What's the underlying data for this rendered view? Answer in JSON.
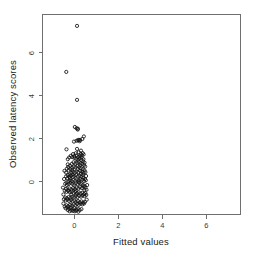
{
  "chart_data": {
    "type": "scatter",
    "title": "",
    "subtitle": "",
    "xlabel": "Fitted values",
    "ylabel": "Observed latency scores",
    "xlim": [
      -1.45,
      7.55
    ],
    "ylim": [
      -1.55,
      7.75
    ],
    "xticks": [
      0,
      2,
      4,
      6
    ],
    "xticklabels": [
      "0",
      "2",
      "4",
      "6"
    ],
    "yticks": [
      0,
      2,
      4,
      6
    ],
    "yticklabels": [
      "0",
      "2",
      "4",
      "6"
    ],
    "grid": false,
    "legend": null,
    "marker": {
      "shape": "open-circle",
      "pch": 1,
      "color": "#111111",
      "fill": "none",
      "size": 3.2
    },
    "frame": "box",
    "annotations": [],
    "points": [
      {
        "x": 0.12,
        "y": 7.22
      },
      {
        "x": -0.37,
        "y": 5.08
      },
      {
        "x": 0.12,
        "y": 3.78
      },
      {
        "x": 0.02,
        "y": 2.52
      },
      {
        "x": 0.1,
        "y": 2.46
      },
      {
        "x": 0.15,
        "y": 2.4
      },
      {
        "x": 0.16,
        "y": 2.44
      },
      {
        "x": 0.43,
        "y": 2.08
      },
      {
        "x": 0.36,
        "y": 1.96
      },
      {
        "x": 0.1,
        "y": 1.88
      },
      {
        "x": 0.16,
        "y": 1.9
      },
      {
        "x": 0.2,
        "y": 1.92
      },
      {
        "x": 0.24,
        "y": 1.86
      },
      {
        "x": 0.26,
        "y": 1.92
      },
      {
        "x": -0.02,
        "y": 1.84
      },
      {
        "x": -0.36,
        "y": 1.48
      },
      {
        "x": 0.12,
        "y": 1.5
      },
      {
        "x": 0.3,
        "y": 1.42
      },
      {
        "x": 0.38,
        "y": 1.3
      },
      {
        "x": 0.42,
        "y": 1.24
      },
      {
        "x": 0.34,
        "y": 1.2
      },
      {
        "x": 0.28,
        "y": 1.26
      },
      {
        "x": 0.2,
        "y": 1.34
      },
      {
        "x": 0.06,
        "y": 1.3
      },
      {
        "x": -0.06,
        "y": 1.26
      },
      {
        "x": -0.16,
        "y": 1.18
      },
      {
        "x": -0.24,
        "y": 1.1
      },
      {
        "x": -0.3,
        "y": 1.02
      },
      {
        "x": -0.1,
        "y": 1.12
      },
      {
        "x": 0.0,
        "y": 1.08
      },
      {
        "x": 0.08,
        "y": 1.04
      },
      {
        "x": 0.16,
        "y": 1.0
      },
      {
        "x": 0.24,
        "y": 1.06
      },
      {
        "x": 0.32,
        "y": 0.98
      },
      {
        "x": 0.4,
        "y": 0.92
      },
      {
        "x": 0.46,
        "y": 0.86
      },
      {
        "x": 0.44,
        "y": 0.74
      },
      {
        "x": 0.36,
        "y": 0.8
      },
      {
        "x": 0.28,
        "y": 0.84
      },
      {
        "x": 0.2,
        "y": 0.9
      },
      {
        "x": 0.12,
        "y": 0.86
      },
      {
        "x": 0.04,
        "y": 0.82
      },
      {
        "x": -0.04,
        "y": 0.88
      },
      {
        "x": -0.12,
        "y": 0.8
      },
      {
        "x": -0.2,
        "y": 0.72
      },
      {
        "x": -0.28,
        "y": 0.66
      },
      {
        "x": -0.34,
        "y": 0.58
      },
      {
        "x": -0.26,
        "y": 0.5
      },
      {
        "x": -0.18,
        "y": 0.56
      },
      {
        "x": -0.1,
        "y": 0.62
      },
      {
        "x": -0.02,
        "y": 0.68
      },
      {
        "x": 0.06,
        "y": 0.64
      },
      {
        "x": 0.14,
        "y": 0.7
      },
      {
        "x": 0.22,
        "y": 0.66
      },
      {
        "x": 0.3,
        "y": 0.6
      },
      {
        "x": 0.38,
        "y": 0.56
      },
      {
        "x": 0.46,
        "y": 0.5
      },
      {
        "x": 0.5,
        "y": 0.42
      },
      {
        "x": 0.42,
        "y": 0.38
      },
      {
        "x": 0.34,
        "y": 0.44
      },
      {
        "x": 0.26,
        "y": 0.48
      },
      {
        "x": 0.18,
        "y": 0.42
      },
      {
        "x": 0.1,
        "y": 0.46
      },
      {
        "x": 0.02,
        "y": 0.4
      },
      {
        "x": -0.06,
        "y": 0.44
      },
      {
        "x": -0.14,
        "y": 0.38
      },
      {
        "x": -0.22,
        "y": 0.32
      },
      {
        "x": -0.3,
        "y": 0.28
      },
      {
        "x": -0.38,
        "y": 0.22
      },
      {
        "x": -0.32,
        "y": 0.14
      },
      {
        "x": -0.24,
        "y": 0.2
      },
      {
        "x": -0.16,
        "y": 0.26
      },
      {
        "x": -0.08,
        "y": 0.3
      },
      {
        "x": 0.0,
        "y": 0.24
      },
      {
        "x": 0.08,
        "y": 0.28
      },
      {
        "x": 0.16,
        "y": 0.22
      },
      {
        "x": 0.24,
        "y": 0.26
      },
      {
        "x": 0.32,
        "y": 0.2
      },
      {
        "x": 0.4,
        "y": 0.16
      },
      {
        "x": 0.48,
        "y": 0.1
      },
      {
        "x": 0.52,
        "y": 0.04
      },
      {
        "x": 0.44,
        "y": 0.0
      },
      {
        "x": 0.36,
        "y": 0.06
      },
      {
        "x": 0.28,
        "y": 0.1
      },
      {
        "x": 0.2,
        "y": 0.04
      },
      {
        "x": 0.12,
        "y": 0.08
      },
      {
        "x": 0.04,
        "y": 0.02
      },
      {
        "x": -0.04,
        "y": 0.06
      },
      {
        "x": -0.12,
        "y": 0.0
      },
      {
        "x": -0.2,
        "y": 0.04
      },
      {
        "x": -0.28,
        "y": -0.02
      },
      {
        "x": -0.36,
        "y": -0.06
      },
      {
        "x": -0.42,
        "y": -0.12
      },
      {
        "x": -0.34,
        "y": -0.18
      },
      {
        "x": -0.26,
        "y": -0.14
      },
      {
        "x": -0.18,
        "y": -0.08
      },
      {
        "x": -0.1,
        "y": -0.12
      },
      {
        "x": -0.02,
        "y": -0.16
      },
      {
        "x": 0.06,
        "y": -0.1
      },
      {
        "x": 0.14,
        "y": -0.14
      },
      {
        "x": 0.22,
        "y": -0.08
      },
      {
        "x": 0.3,
        "y": -0.12
      },
      {
        "x": 0.38,
        "y": -0.18
      },
      {
        "x": 0.46,
        "y": -0.22
      },
      {
        "x": 0.5,
        "y": -0.3
      },
      {
        "x": 0.42,
        "y": -0.26
      },
      {
        "x": 0.34,
        "y": -0.32
      },
      {
        "x": 0.26,
        "y": -0.28
      },
      {
        "x": 0.18,
        "y": -0.34
      },
      {
        "x": 0.1,
        "y": -0.3
      },
      {
        "x": 0.02,
        "y": -0.36
      },
      {
        "x": -0.06,
        "y": -0.32
      },
      {
        "x": -0.14,
        "y": -0.38
      },
      {
        "x": -0.22,
        "y": -0.34
      },
      {
        "x": -0.3,
        "y": -0.4
      },
      {
        "x": -0.38,
        "y": -0.36
      },
      {
        "x": -0.44,
        "y": -0.44
      },
      {
        "x": -0.36,
        "y": -0.5
      },
      {
        "x": -0.28,
        "y": -0.46
      },
      {
        "x": -0.2,
        "y": -0.52
      },
      {
        "x": -0.12,
        "y": -0.48
      },
      {
        "x": -0.04,
        "y": -0.54
      },
      {
        "x": 0.04,
        "y": -0.5
      },
      {
        "x": 0.12,
        "y": -0.56
      },
      {
        "x": 0.2,
        "y": -0.52
      },
      {
        "x": 0.28,
        "y": -0.58
      },
      {
        "x": 0.36,
        "y": -0.54
      },
      {
        "x": 0.44,
        "y": -0.6
      },
      {
        "x": 0.5,
        "y": -0.56
      },
      {
        "x": 0.54,
        "y": -0.64
      },
      {
        "x": 0.46,
        "y": -0.7
      },
      {
        "x": 0.38,
        "y": -0.66
      },
      {
        "x": 0.3,
        "y": -0.72
      },
      {
        "x": 0.22,
        "y": -0.68
      },
      {
        "x": 0.14,
        "y": -0.74
      },
      {
        "x": 0.06,
        "y": -0.7
      },
      {
        "x": -0.02,
        "y": -0.76
      },
      {
        "x": -0.1,
        "y": -0.72
      },
      {
        "x": -0.18,
        "y": -0.78
      },
      {
        "x": -0.26,
        "y": -0.74
      },
      {
        "x": -0.34,
        "y": -0.8
      },
      {
        "x": -0.42,
        "y": -0.76
      },
      {
        "x": -0.48,
        "y": -0.84
      },
      {
        "x": -0.4,
        "y": -0.9
      },
      {
        "x": -0.32,
        "y": -0.86
      },
      {
        "x": -0.24,
        "y": -0.92
      },
      {
        "x": -0.16,
        "y": -0.88
      },
      {
        "x": -0.08,
        "y": -0.94
      },
      {
        "x": 0.0,
        "y": -0.9
      },
      {
        "x": 0.08,
        "y": -0.96
      },
      {
        "x": 0.16,
        "y": -0.92
      },
      {
        "x": 0.24,
        "y": -0.98
      },
      {
        "x": 0.32,
        "y": -0.94
      },
      {
        "x": 0.4,
        "y": -1.0
      },
      {
        "x": 0.48,
        "y": -0.96
      },
      {
        "x": 0.44,
        "y": -1.04
      },
      {
        "x": 0.36,
        "y": -1.08
      },
      {
        "x": 0.28,
        "y": -1.04
      },
      {
        "x": 0.2,
        "y": -1.1
      },
      {
        "x": 0.12,
        "y": -1.06
      },
      {
        "x": 0.04,
        "y": -1.12
      },
      {
        "x": -0.04,
        "y": -1.08
      },
      {
        "x": -0.12,
        "y": -1.14
      },
      {
        "x": -0.2,
        "y": -1.1
      },
      {
        "x": -0.28,
        "y": -1.16
      },
      {
        "x": -0.36,
        "y": -1.12
      },
      {
        "x": -0.44,
        "y": -1.18
      },
      {
        "x": -0.4,
        "y": -1.26
      },
      {
        "x": -0.32,
        "y": -1.22
      },
      {
        "x": -0.24,
        "y": -1.28
      },
      {
        "x": -0.16,
        "y": -1.24
      },
      {
        "x": -0.08,
        "y": -1.3
      },
      {
        "x": 0.0,
        "y": -1.26
      },
      {
        "x": 0.08,
        "y": -1.32
      },
      {
        "x": 0.16,
        "y": -1.28
      },
      {
        "x": 0.24,
        "y": -1.34
      },
      {
        "x": 0.32,
        "y": -1.3
      },
      {
        "x": -0.06,
        "y": -1.38
      },
      {
        "x": -0.14,
        "y": -1.36
      },
      {
        "x": -0.22,
        "y": -1.4
      },
      {
        "x": 0.02,
        "y": -1.4
      },
      {
        "x": 0.1,
        "y": -1.36
      },
      {
        "x": -0.3,
        "y": -1.34
      },
      {
        "x": 0.18,
        "y": -1.42
      },
      {
        "x": 0.55,
        "y": -0.4
      },
      {
        "x": 0.58,
        "y": -0.18
      },
      {
        "x": 0.53,
        "y": 0.24
      },
      {
        "x": 0.49,
        "y": 0.68
      },
      {
        "x": 0.56,
        "y": -0.86
      },
      {
        "x": -0.5,
        "y": -0.62
      },
      {
        "x": -0.52,
        "y": -0.3
      },
      {
        "x": -0.47,
        "y": 0.1
      },
      {
        "x": -0.45,
        "y": 0.48
      },
      {
        "x": -0.5,
        "y": -1.04
      },
      {
        "x": 0.33,
        "y": 1.1
      },
      {
        "x": 0.25,
        "y": 1.16
      },
      {
        "x": 0.41,
        "y": 1.02
      },
      {
        "x": 0.09,
        "y": 1.2
      },
      {
        "x": -0.01,
        "y": 1.16
      },
      {
        "x": 0.17,
        "y": 1.12
      },
      {
        "x": 0.2,
        "y": -0.02
      },
      {
        "x": 0.06,
        "y": -0.44
      },
      {
        "x": -0.1,
        "y": 0.52
      },
      {
        "x": 0.3,
        "y": 0.34
      },
      {
        "x": -0.2,
        "y": 0.14
      },
      {
        "x": 0.14,
        "y": 0.56
      },
      {
        "x": -0.3,
        "y": 0.78
      },
      {
        "x": 0.26,
        "y": 0.74
      },
      {
        "x": 0.08,
        "y": -0.62
      },
      {
        "x": -0.14,
        "y": -0.62
      },
      {
        "x": 0.38,
        "y": 0.3
      },
      {
        "x": -0.06,
        "y": 0.2
      },
      {
        "x": 0.46,
        "y": -0.42
      },
      {
        "x": -0.38,
        "y": 0.4
      }
    ]
  },
  "figure": {
    "background_color": "#ffffff",
    "frame_color": "#6f6f6f",
    "text_color": "#1a1a1a",
    "marker_color": "#111111"
  }
}
